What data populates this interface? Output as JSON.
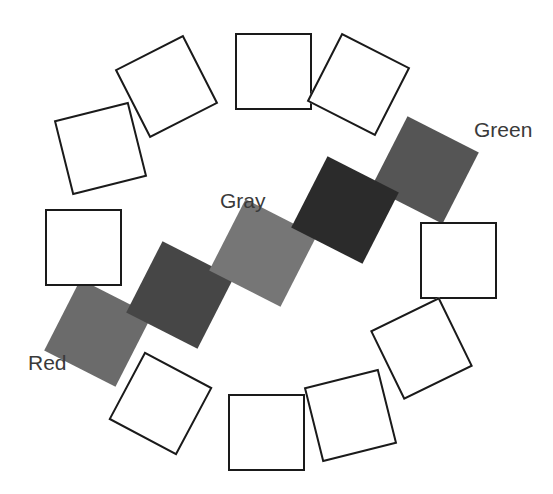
{
  "figure": {
    "background_color": "#ffffff",
    "outline_color": "#1a1a1a",
    "label_color": "#3a3a3a",
    "canvas": {
      "width": 553,
      "height": 494
    }
  },
  "labels": [
    {
      "id": "green",
      "text": "Green",
      "x": 474,
      "y": 119
    },
    {
      "id": "gray",
      "text": "Gray",
      "x": 220,
      "y": 190
    },
    {
      "id": "red",
      "text": "Red",
      "x": 28,
      "y": 352
    }
  ],
  "chart_data": {
    "type": "scatter",
    "xlabel": "",
    "ylabel": "",
    "xlim": [
      0,
      553
    ],
    "ylim": [
      0,
      494
    ],
    "grid": false,
    "legend_position": "none",
    "annotations": [
      "Green",
      "Gray",
      "Red"
    ],
    "squares": [
      {
        "index": 0,
        "name": "square-top",
        "fill": "none",
        "filled": false,
        "x": 235,
        "y": 33,
        "size": 77,
        "rotation": 0,
        "label": null
      },
      {
        "index": 1,
        "name": "square-top-right",
        "fill": "none",
        "filled": false,
        "x": 320,
        "y": 46,
        "size": 77,
        "rotation": 27,
        "label": null
      },
      {
        "index": 2,
        "name": "square-green",
        "fill": "#555555",
        "filled": true,
        "x": 385,
        "y": 130,
        "size": 80,
        "rotation": 27,
        "label": "Green"
      },
      {
        "index": 3,
        "name": "square-right",
        "fill": "none",
        "filled": false,
        "x": 420,
        "y": 222,
        "size": 77,
        "rotation": 0,
        "label": null
      },
      {
        "index": 4,
        "name": "square-bottom-right",
        "fill": "none",
        "filled": false,
        "x": 383,
        "y": 310,
        "size": 77,
        "rotation": -26,
        "label": null
      },
      {
        "index": 5,
        "name": "square-bottom-right-2",
        "fill": "none",
        "filled": false,
        "x": 312,
        "y": 377,
        "size": 77,
        "rotation": -14,
        "label": null
      },
      {
        "index": 6,
        "name": "square-bottom",
        "fill": "none",
        "filled": false,
        "x": 228,
        "y": 394,
        "size": 77,
        "rotation": 0,
        "label": null
      },
      {
        "index": 7,
        "name": "square-bottom-left",
        "fill": "none",
        "filled": false,
        "x": 122,
        "y": 365,
        "size": 77,
        "rotation": 28,
        "label": null
      },
      {
        "index": 8,
        "name": "square-red",
        "fill": "#6b6b6b",
        "filled": true,
        "x": 58,
        "y": 293,
        "size": 80,
        "rotation": 27,
        "label": "Red"
      },
      {
        "index": 9,
        "name": "square-dark-left",
        "fill": "#464646",
        "filled": true,
        "x": 140,
        "y": 255,
        "size": 80,
        "rotation": 27,
        "label": null
      },
      {
        "index": 10,
        "name": "square-gray-center",
        "fill": "#767676",
        "filled": true,
        "x": 223,
        "y": 213,
        "size": 80,
        "rotation": 27,
        "label": "Gray"
      },
      {
        "index": 11,
        "name": "square-darkest",
        "fill": "#2b2b2b",
        "filled": true,
        "x": 305,
        "y": 170,
        "size": 80,
        "rotation": 27,
        "label": null
      },
      {
        "index": 12,
        "name": "square-left",
        "fill": "none",
        "filled": false,
        "x": 45,
        "y": 209,
        "size": 77,
        "rotation": 0,
        "label": null
      },
      {
        "index": 13,
        "name": "square-upper-left",
        "fill": "none",
        "filled": false,
        "x": 62,
        "y": 110,
        "size": 77,
        "rotation": -14,
        "label": null
      },
      {
        "index": 14,
        "name": "square-upper-left-2",
        "fill": "none",
        "filled": false,
        "x": 128,
        "y": 48,
        "size": 77,
        "rotation": -27,
        "label": null
      }
    ]
  }
}
